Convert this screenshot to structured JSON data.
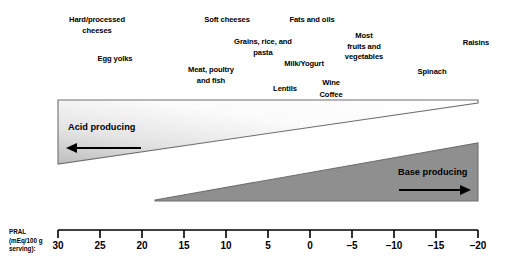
{
  "diagram": {
    "foods": [
      {
        "name": "hard-processed-cheeses",
        "label": "Hard/processed\ncheeses",
        "x": 97,
        "y": 15
      },
      {
        "name": "egg-yolks",
        "label": "Egg yolks",
        "x": 115,
        "y": 54
      },
      {
        "name": "soft-cheeses",
        "label": "Soft cheeses",
        "x": 227,
        "y": 15
      },
      {
        "name": "fats-and-oils",
        "label": "Fats and oils",
        "x": 312,
        "y": 15
      },
      {
        "name": "grains-rice-and-pasta",
        "label": "Grains, rice, and\npasta",
        "x": 263,
        "y": 37
      },
      {
        "name": "most-fruits-and-vegetables",
        "label": "Most\nfruits and\nvegetables",
        "x": 364,
        "y": 31
      },
      {
        "name": "raisins",
        "label": "Raisins",
        "x": 476,
        "y": 38
      },
      {
        "name": "milk-yogurt",
        "label": "Milk/Yogurt",
        "x": 304,
        "y": 59
      },
      {
        "name": "meat-poultry-and-fish",
        "label": "Meat, poultry\nand fish",
        "x": 211,
        "y": 65
      },
      {
        "name": "spinach",
        "label": "Spinach",
        "x": 432,
        "y": 67
      },
      {
        "name": "wine",
        "label": "Wine",
        "x": 331,
        "y": 78
      },
      {
        "name": "lentils",
        "label": "Lentils",
        "x": 285,
        "y": 84
      },
      {
        "name": "coffee",
        "label": "Coffee",
        "x": 331,
        "y": 90
      }
    ],
    "acid_wedge": {
      "label": "Acid producing",
      "arrow": "left-arrow",
      "fill_light": "#efefef",
      "fill_dark": "#b9b9b9",
      "stroke": "#6e6e6e"
    },
    "base_wedge": {
      "label": "Base producing",
      "arrow": "right-arrow",
      "fill": "#8f8f8f",
      "stroke": "#6e6e6e"
    },
    "axis": {
      "caption": "PRAL\n(mEq/100 g\nserving):",
      "color": "#000000",
      "ticks": [
        {
          "label": "30",
          "x": 58
        },
        {
          "label": "25",
          "x": 100
        },
        {
          "label": "20",
          "x": 142
        },
        {
          "label": "15",
          "x": 184
        },
        {
          "label": "10",
          "x": 226
        },
        {
          "label": "5",
          "x": 268
        },
        {
          "label": "0",
          "x": 310
        },
        {
          "label": "–5",
          "x": 352
        },
        {
          "label": "–10",
          "x": 394
        },
        {
          "label": "–15",
          "x": 436
        },
        {
          "label": "–20",
          "x": 478
        }
      ]
    }
  },
  "chart_data": {
    "type": "diagram",
    "xlabel": "PRAL (mEq/100 g serving):",
    "xlim": [
      30,
      -20
    ],
    "xticks": [
      30,
      25,
      20,
      15,
      10,
      5,
      0,
      -5,
      -10,
      -15,
      -20
    ],
    "grid": false,
    "legend": [
      "Acid producing",
      "Base producing"
    ],
    "annotations": [
      {
        "text": "Hard/processed cheeses",
        "pral_approx": 25.4
      },
      {
        "text": "Egg yolks",
        "pral_approx": 23.2
      },
      {
        "text": "Soft cheeses",
        "pral_approx": 9.9
      },
      {
        "text": "Fats and oils",
        "pral_approx": 0.0
      },
      {
        "text": "Grains, rice, and pasta",
        "pral_approx": 5.6
      },
      {
        "text": "Milk/Yogurt",
        "pral_approx": 0.7
      },
      {
        "text": "Meat, poultry and fish",
        "pral_approx": 11.8
      },
      {
        "text": "Lentils",
        "pral_approx": 3.0
      },
      {
        "text": "Wine",
        "pral_approx": -2.5
      },
      {
        "text": "Coffee",
        "pral_approx": -2.5
      },
      {
        "text": "Most fruits and vegetables",
        "pral_approx": -6.4
      },
      {
        "text": "Spinach",
        "pral_approx": -14.5
      },
      {
        "text": "Raisins",
        "pral_approx": -19.8
      }
    ]
  }
}
